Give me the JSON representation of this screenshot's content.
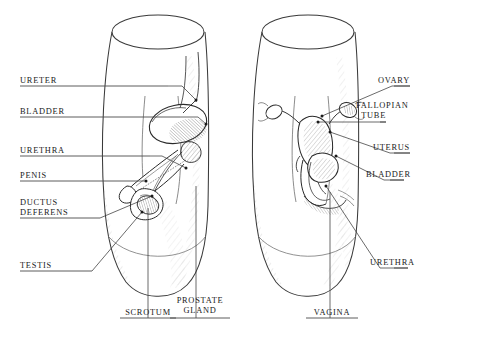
{
  "figure": {
    "background_color": "#ffffff",
    "ink_color": "#1a1a1a",
    "line_color": "#3a3a3a",
    "shade_color": "#9a9a9a",
    "panels": [
      {
        "name": "male-torso",
        "label": "Male pelvis cutaway"
      },
      {
        "name": "female-torso",
        "label": "Female pelvis cutaway"
      }
    ]
  },
  "labels": {
    "left": [
      {
        "id": "ureter",
        "text": "URETER",
        "x": 20,
        "y": 76,
        "rule_y": 86,
        "rule_x2": 168,
        "leader": "M168,86 L182,86 L196,100"
      },
      {
        "id": "bladder",
        "text": "BLADDER",
        "x": 20,
        "y": 107,
        "rule_y": 117,
        "rule_x2": 180,
        "leader": "M180,117 L198,117 L206,124"
      },
      {
        "id": "urethra",
        "text": "URETHRA",
        "x": 20,
        "y": 146,
        "rule_y": 156,
        "rule_x2": 150,
        "leader": "M150,156 L162,156 L186,168"
      },
      {
        "id": "penis",
        "text": "PENIS",
        "x": 20,
        "y": 171,
        "rule_y": 181,
        "rule_x2": 138,
        "leader": "M138,181 L146,181"
      },
      {
        "id": "ductus",
        "text": "DUCTUS\nDEFERENS",
        "x": 20,
        "y": 198,
        "rule_y": 218,
        "rule_x2": 100,
        "leader": "M100,218 L152,196"
      },
      {
        "id": "testis",
        "text": "TESTIS",
        "x": 20,
        "y": 261,
        "rule_y": 271,
        "rule_x2": 92,
        "leader": "M92,271 L142,212"
      }
    ],
    "right": [
      {
        "id": "ovary",
        "text": "OVARY",
        "x": 400,
        "y": 76,
        "rule_y": 86,
        "rule_x1": 410,
        "leader": "M410,86 L392,86 L322,116"
      },
      {
        "id": "fallopian",
        "text": "FALLOPIAN\nTUBE",
        "x": 386,
        "y": 101,
        "rule_y": 122,
        "rule_x1": 386,
        "leader": "M386,122 L318,122"
      },
      {
        "id": "uterus",
        "text": "UTERUS",
        "x": 400,
        "y": 143,
        "rule_y": 153,
        "rule_x1": 410,
        "leader": "M410,153 L390,153 L330,132"
      },
      {
        "id": "bladder_f",
        "text": "BLADDER",
        "x": 396,
        "y": 170,
        "rule_y": 180,
        "rule_x1": 404,
        "leader": "M404,180 L384,180 L336,156"
      },
      {
        "id": "urethra_f",
        "text": "URETHRA",
        "x": 400,
        "y": 258,
        "rule_y": 268,
        "rule_x1": 408,
        "leader": "M408,268 L380,268 L326,186"
      }
    ],
    "bottom": [
      {
        "id": "scrotum",
        "text": "SCROTUM",
        "x": 120,
        "y": 308,
        "w": 56,
        "rule_y": 318,
        "leader": "M148,318 L148,208"
      },
      {
        "id": "prostate",
        "text": "PROSTATE\nGLAND",
        "x": 170,
        "y": 296,
        "w": 60,
        "rule_y": 318,
        "leader": "M196,318 L196,186"
      },
      {
        "id": "vagina",
        "text": "VAGINA",
        "x": 306,
        "y": 308,
        "w": 52,
        "rule_y": 318,
        "leader": "M330,318 L330,192"
      }
    ]
  }
}
